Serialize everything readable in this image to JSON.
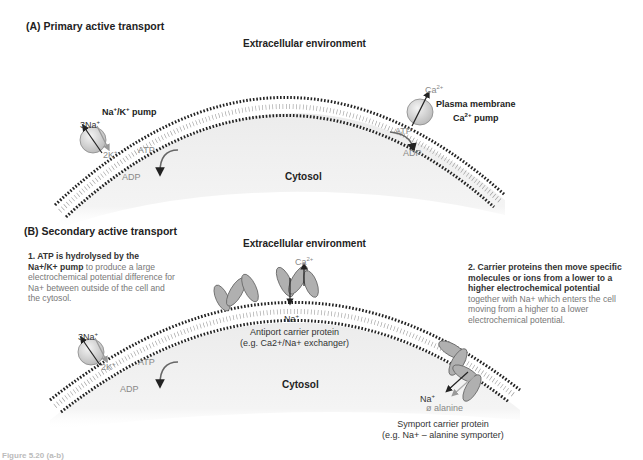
{
  "panelA": {
    "title": "(A)  Primary active transport",
    "extracellular": "Extracellular environment",
    "cytosol": "Cytosol",
    "nak_pump_label_main": "Na",
    "nak_pump_label_mid": "/K",
    "nak_pump_label_end": " pump",
    "na_ions": "3Na",
    "k_ions": "2K",
    "atp": "ATP",
    "adp": "ADP",
    "ca_ion": "Ca",
    "ca_charge": "2+",
    "ca_pump_line1": "Plasma membrane",
    "ca_pump_line2_a": "Ca",
    "ca_pump_line2_b": "2+",
    "ca_pump_line2_c": " pump"
  },
  "panelB": {
    "title": "(B)  Secondary active transport",
    "extracellular": "Extracellular environment",
    "cytosol": "Cytosol",
    "na_ions": "3Na",
    "k_ions": "2K",
    "atp": "ATP",
    "adp": "ADP",
    "ca_ion": "Ca",
    "ca_charge": "2+",
    "na_ion": "Na",
    "antiport_line1": "Antiport carrier protein",
    "antiport_line2": "(e.g. Ca2+/Na+ exchanger)",
    "symport_na": "Na",
    "symport_alanine": "alanine",
    "symport_line1": "Symport carrier protein",
    "symport_line2": "(e.g. Na+ – alanine symporter)",
    "note1": {
      "bold1": "1. ATP  is hydrolysed  by the",
      "bold2": "Na+/K+ pump",
      "text": " to produce a large electrochemical potential difference for Na+ between outside of the cell and the cytosol."
    },
    "note2": {
      "bold": "2. Carrier proteins then move specific molecules or ions from a lower to a higher electrochemical potential",
      "text": " together with Na+ which enters the cell moving from a higher to a lower electrochemical potential."
    }
  },
  "caption": "Figure 5.20 (a-b)"
}
